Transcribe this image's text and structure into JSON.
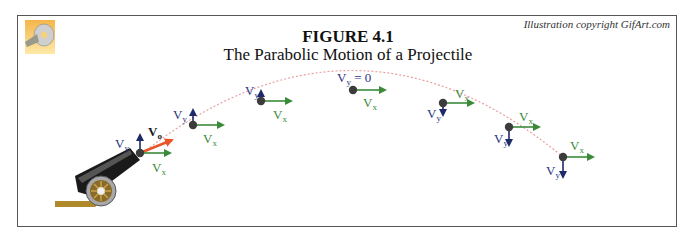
{
  "figure": {
    "title": "FIGURE 4.1",
    "subtitle": "The Parabolic Motion of a Projectile",
    "credit": "Illustration copyright GifArt.com"
  },
  "icons": {
    "logo": "cd-disc-icon",
    "cannon": "cannon-icon"
  },
  "colors": {
    "vx_arrow": "#3a8a3a",
    "vy_arrow": "#1f2a6b",
    "v0_arrow": "#e8562a",
    "vx_label": "#3a8a3a",
    "vy_label": "#2a3580",
    "trajectory": "#e8a0a0",
    "point": "#3c3c3c",
    "frame": "#555555"
  },
  "labels": {
    "vx": "V",
    "vx_sub": "x",
    "vy": "V",
    "vy_sub": "y",
    "v0": "V",
    "v0_sub": "o",
    "vy_zero": "= 0"
  },
  "points": [
    {
      "id": "launch",
      "vy_dir": "up",
      "has_v0": true
    },
    {
      "id": "p1",
      "vy_dir": "up"
    },
    {
      "id": "p2",
      "vy_dir": "up-small"
    },
    {
      "id": "apex",
      "vy_dir": "zero"
    },
    {
      "id": "p4",
      "vy_dir": "down-small"
    },
    {
      "id": "p5",
      "vy_dir": "down"
    },
    {
      "id": "p6",
      "vy_dir": "down"
    }
  ]
}
